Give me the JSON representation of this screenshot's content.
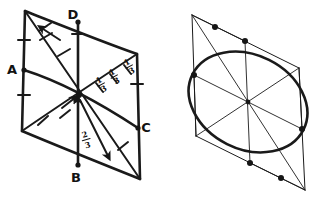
{
  "figure": {
    "ink_color": "#1a1a1a",
    "background_color": "#ffffff",
    "left_panel": {
      "name": "parallelogram-with-vectors",
      "vertices": [
        {
          "id": "D",
          "label": "D",
          "x": 78,
          "y": 22,
          "label_x": 73,
          "label_y": 19
        },
        {
          "id": "A",
          "label": "A",
          "x": 24,
          "y": 70,
          "label_x": 10,
          "label_y": 74
        },
        {
          "id": "C",
          "label": "C",
          "x": 138,
          "y": 128,
          "label_x": 143,
          "label_y": 132
        },
        {
          "id": "B",
          "label": "B",
          "x": 78,
          "y": 165,
          "label_x": 73,
          "label_y": 180
        }
      ],
      "corners": [
        {
          "id": "top-left",
          "x": 25,
          "y": 11
        },
        {
          "id": "top-right",
          "x": 137,
          "y": 54
        },
        {
          "id": "bottom-right",
          "x": 140,
          "y": 179
        },
        {
          "id": "bottom-left",
          "x": 22,
          "y": 131
        }
      ],
      "centroid": {
        "x": 79,
        "y": 95
      },
      "fraction_labels": [
        {
          "id": "frac-one-third-left",
          "numerator": "1",
          "denominator": "3",
          "x": 101,
          "y": 84
        },
        {
          "id": "frac-one-third-mid",
          "numerator": "1",
          "denominator": "3",
          "x": 114,
          "y": 76
        },
        {
          "id": "frac-one-third-right",
          "numerator": "1",
          "denominator": "3",
          "x": 128,
          "y": 67
        },
        {
          "id": "frac-two-thirds",
          "numerator": "2",
          "denominator": "3",
          "x": 85,
          "y": 140
        }
      ]
    },
    "right_panel": {
      "name": "parallelogram-with-inscribed-ellipse",
      "corners": [
        {
          "id": "top-left",
          "x": 192,
          "y": 15
        },
        {
          "id": "top-right",
          "x": 299,
          "y": 68
        },
        {
          "id": "bottom-right",
          "x": 305,
          "y": 190
        },
        {
          "id": "bottom-left",
          "x": 196,
          "y": 136
        }
      ],
      "center": {
        "x": 248,
        "y": 102
      },
      "ellipse": {
        "tangent_points": [
          {
            "id": "tangent-top",
            "x": 245,
            "y": 41
          },
          {
            "id": "tangent-upper-left",
            "x": 194,
            "y": 75
          },
          {
            "id": "tangent-upper-right",
            "x": 302,
            "y": 129
          },
          {
            "id": "tangent-bottom",
            "x": 250,
            "y": 163
          },
          {
            "id": "tangent-lower-left",
            "x": 215,
            "y": 25
          },
          {
            "id": "tangent-lower-right",
            "x": 281,
            "y": 178
          }
        ]
      }
    }
  }
}
